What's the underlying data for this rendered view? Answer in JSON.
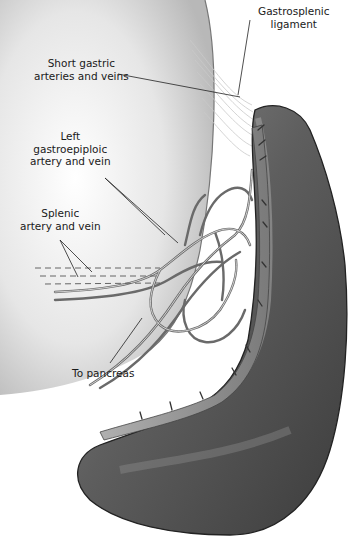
{
  "figure": {
    "colors": {
      "organ": "#6a6a6a",
      "organ_dark": "#3a3a3a",
      "stomach": "#d8d8d8",
      "vessel": "#8c8c8c",
      "leader": "#222222",
      "background": "#ffffff"
    }
  },
  "labels": [
    {
      "id": "gastrosplenic",
      "lines": [
        "Gastrosplenic",
        "ligament"
      ]
    },
    {
      "id": "short-gastric",
      "lines": [
        "Short gastric",
        "arteries and veins"
      ]
    },
    {
      "id": "left-gastroepiploic",
      "lines": [
        "Left",
        "gastroepiploic",
        "artery and vein"
      ]
    },
    {
      "id": "splenic",
      "lines": [
        "Splenic",
        "artery and vein"
      ]
    },
    {
      "id": "pancreas",
      "lines": [
        "To pancreas"
      ]
    }
  ]
}
